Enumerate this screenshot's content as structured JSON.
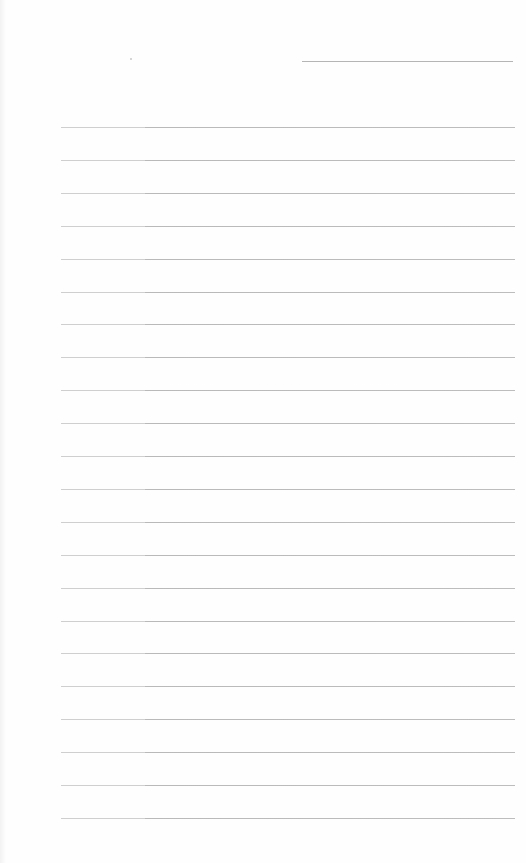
{
  "page": {
    "type": "blank lined notebook page",
    "background_color": "#fefefe",
    "line_color": "#bdbdbd"
  },
  "header": {
    "date_field": "",
    "title_field": ""
  },
  "ruled_lines": {
    "count": 22,
    "first_y": 127,
    "spacing": 32.9,
    "entries": [
      "",
      "",
      "",
      "",
      "",
      "",
      "",
      "",
      "",
      "",
      "",
      "",
      "",
      "",
      "",
      "",
      "",
      "",
      "",
      "",
      "",
      ""
    ]
  }
}
